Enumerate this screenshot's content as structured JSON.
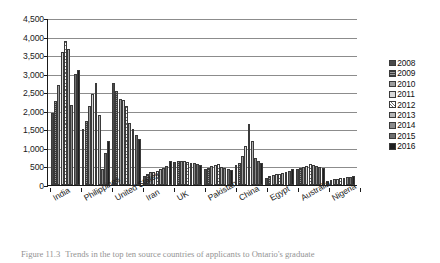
{
  "figure": {
    "caption_number": "Figure 11.3",
    "caption_text": "Trends in the top ten source countries of applicants to Ontario's graduate"
  },
  "chart_data": {
    "type": "bar",
    "title": "",
    "xlabel": "",
    "ylabel": "",
    "ylim": [
      0,
      4500
    ],
    "ytick_step": 500,
    "grid": true,
    "legend_position": "right",
    "categories": [
      "India",
      "Philippines",
      "United States",
      "Iran",
      "UK",
      "Pakistan",
      "China",
      "Egypt",
      "Australia",
      "Nigeria"
    ],
    "ytick_labels": [
      "4,500",
      "4,000",
      "3,500",
      "3,000",
      "2,500",
      "2,000",
      "1,500",
      "1,000",
      "500",
      "0"
    ],
    "series": [
      {
        "name": "2008",
        "values": [
          1950,
          1500,
          2740,
          230,
          630,
          440,
          530,
          200,
          420,
          120
        ]
      },
      {
        "name": "2009",
        "values": [
          2270,
          1720,
          2520,
          300,
          640,
          470,
          580,
          230,
          450,
          130
        ]
      },
      {
        "name": "2010",
        "values": [
          2690,
          2130,
          2320,
          340,
          650,
          520,
          780,
          260,
          480,
          150
        ]
      },
      {
        "name": "2011",
        "values": [
          3580,
          2450,
          2300,
          360,
          640,
          540,
          1040,
          290,
          520,
          170
        ]
      },
      {
        "name": "2012",
        "values": [
          3890,
          2740,
          2120,
          390,
          620,
          560,
          1650,
          300,
          560,
          190
        ]
      },
      {
        "name": "2013",
        "values": [
          3660,
          1880,
          1680,
          430,
          600,
          480,
          1180,
          330,
          540,
          200
        ]
      },
      {
        "name": "2014",
        "values": [
          2160,
          430,
          1500,
          470,
          580,
          460,
          720,
          360,
          520,
          210
        ]
      },
      {
        "name": "2015",
        "values": [
          2980,
          850,
          1360,
          500,
          560,
          430,
          640,
          390,
          480,
          220
        ]
      },
      {
        "name": "2016",
        "values": [
          3090,
          1180,
          1240,
          640,
          540,
          410,
          600,
          430,
          450,
          230
        ]
      }
    ]
  },
  "legend": {
    "items": [
      {
        "label": "2008"
      },
      {
        "label": "2009"
      },
      {
        "label": "2010"
      },
      {
        "label": "2011"
      },
      {
        "label": "2012"
      },
      {
        "label": "2013"
      },
      {
        "label": "2014"
      },
      {
        "label": "2015"
      },
      {
        "label": "2016"
      }
    ]
  }
}
